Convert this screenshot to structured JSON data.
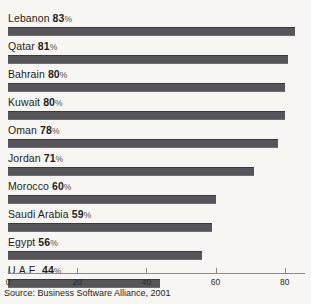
{
  "chart_data": {
    "type": "bar",
    "orientation": "horizontal",
    "title": "",
    "xlabel": "",
    "ylabel": "",
    "xlim": [
      0,
      91
    ],
    "grid": false,
    "legend": null,
    "value_suffix": "%",
    "categories": [
      "Lebanon",
      "Qatar",
      "Bahrain",
      "Kuwait",
      "Oman",
      "Jordan",
      "Morocco",
      "Saudi Arabia",
      "Egypt",
      "U.A.E."
    ],
    "values": [
      83,
      81,
      80,
      80,
      78,
      71,
      60,
      59,
      56,
      44
    ],
    "ticks": [
      0,
      20,
      40,
      60,
      80
    ],
    "tick_labels": [
      "0",
      "20",
      "40",
      "60",
      "80"
    ],
    "bars": [
      {
        "label": "Lebanon",
        "value": 83,
        "value_text": "83",
        "suffix": "%"
      },
      {
        "label": "Qatar",
        "value": 81,
        "value_text": "81",
        "suffix": "%"
      },
      {
        "label": "Bahrain",
        "value": 80,
        "value_text": "80",
        "suffix": "%"
      },
      {
        "label": "Kuwait",
        "value": 80,
        "value_text": "80",
        "suffix": "%"
      },
      {
        "label": "Oman",
        "value": 78,
        "value_text": "78",
        "suffix": "%"
      },
      {
        "label": "Jordan",
        "value": 71,
        "value_text": "71",
        "suffix": "%"
      },
      {
        "label": "Morocco",
        "value": 60,
        "value_text": "60",
        "suffix": "%"
      },
      {
        "label": "Saudi Arabia",
        "value": 59,
        "value_text": "59",
        "suffix": "%"
      },
      {
        "label": "Egypt",
        "value": 56,
        "value_text": "56",
        "suffix": "%"
      },
      {
        "label": "U.A.E.",
        "value": 44,
        "value_text": "44",
        "suffix": "%"
      }
    ],
    "bar_color": "#56565a",
    "background_color": "#f7f6f3"
  },
  "footer": {
    "source": "Source: Business Software Alliance, 2001"
  }
}
